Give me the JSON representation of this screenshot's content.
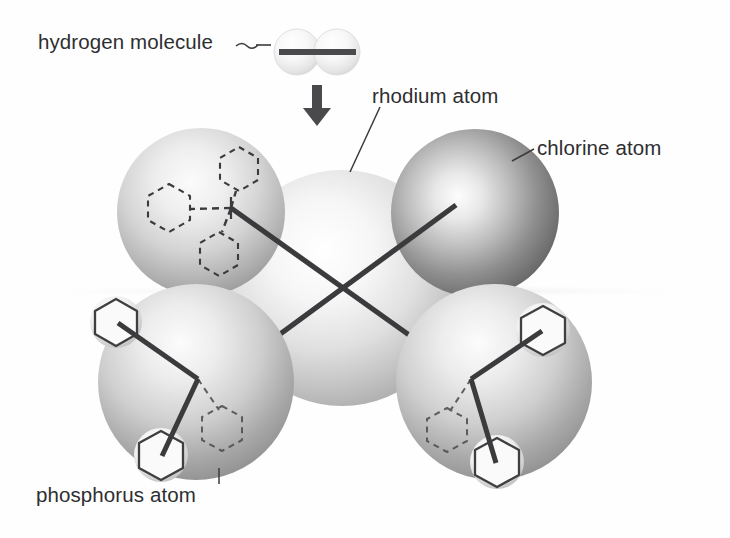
{
  "figure": {
    "kind": "space-filling molecular model",
    "background_color": "#fefefe",
    "label_color": "#2e2e30",
    "bond_color": "#3b3b3d",
    "canvas": {
      "width": 730,
      "height": 538
    }
  },
  "labels": {
    "hydrogen": "hydrogen molecule",
    "rhodium": "rhodium atom",
    "chlorine": "chlorine atom",
    "phosphorus": "phosphorus atom"
  },
  "leaders": {
    "hydrogen": {
      "type": "tilde-dash",
      "x1": 236,
      "y1": 45,
      "x2": 268,
      "y2": 45
    },
    "rhodium": {
      "type": "line",
      "x1": 379,
      "y1": 108,
      "x2": 351,
      "y2": 170
    },
    "chlorine": {
      "type": "line",
      "x1": 534,
      "y1": 150,
      "x2": 513,
      "y2": 160
    },
    "phosphorus": {
      "type": "line",
      "x1": 219,
      "y1": 470,
      "x2": 219,
      "y2": 484
    }
  },
  "arrow": {
    "name": "approach-arrow",
    "direction": "down",
    "x": 317,
    "y_start": 85,
    "y_end": 124,
    "color": "#3b3b3d"
  },
  "hydrogen_molecule": {
    "atoms": [
      {
        "name": "hydrogen-atom-left",
        "cx": 297,
        "cy": 52,
        "r": 23,
        "shade": "very-light"
      },
      {
        "name": "hydrogen-atom-right",
        "cx": 337,
        "cy": 52,
        "r": 23,
        "shade": "very-light"
      }
    ],
    "bond": {
      "x1": 279,
      "y1": 52,
      "x2": 356,
      "y2": 52,
      "width": 6
    }
  },
  "spheres": [
    {
      "name": "rhodium-atom",
      "element": "Rh",
      "cx": 342,
      "cy": 288,
      "r": 118,
      "shade": "lightest",
      "z": 1
    },
    {
      "name": "phosphorus-atom-upper-left",
      "element": "P",
      "cx": 201,
      "cy": 212,
      "r": 84,
      "shade": "light",
      "z": 2
    },
    {
      "name": "chlorine-atom",
      "element": "Cl",
      "cx": 475,
      "cy": 213,
      "r": 84,
      "shade": "dark",
      "z": 2
    },
    {
      "name": "phosphorus-atom-lower-left",
      "element": "P",
      "cx": 196,
      "cy": 382,
      "r": 98,
      "shade": "medium",
      "z": 3
    },
    {
      "name": "phosphorus-atom-lower-right",
      "element": "P",
      "cx": 494,
      "cy": 382,
      "r": 98,
      "shade": "medium",
      "z": 3
    }
  ],
  "bonds": [
    {
      "name": "bond-rhodium-to-upper-left-phosphorus",
      "x1": 231,
      "y1": 208,
      "x2": 459,
      "y2": 370,
      "style": "solid"
    },
    {
      "name": "bond-rhodium-to-chlorine",
      "x1": 228,
      "y1": 372,
      "x2": 455,
      "y2": 206,
      "style": "solid"
    }
  ],
  "phenyl_groups": {
    "upper_left": [
      {
        "name": "phenyl-ring-dashed-top",
        "cx": 239,
        "cy": 169,
        "r": 22,
        "style": "dashed"
      },
      {
        "name": "phenyl-ring-dashed-left",
        "cx": 169,
        "cy": 208,
        "r": 24,
        "style": "dashed"
      },
      {
        "name": "phenyl-ring-dashed-bottom",
        "cx": 219,
        "cy": 254,
        "r": 22,
        "style": "dashed"
      }
    ],
    "lower_left": [
      {
        "name": "phenyl-ring-solid-upper",
        "cx": 116,
        "cy": 322,
        "r": 24,
        "style": "solid"
      },
      {
        "name": "phenyl-ring-solid-lower",
        "cx": 161,
        "cy": 455,
        "r": 25,
        "style": "solid"
      },
      {
        "name": "phenyl-ring-dashed-back",
        "cx": 222,
        "cy": 427,
        "r": 23,
        "style": "dashed"
      }
    ],
    "lower_right": [
      {
        "name": "phenyl-ring-solid-upper",
        "cx": 541,
        "cy": 330,
        "r": 25,
        "style": "solid"
      },
      {
        "name": "phenyl-ring-solid-lower",
        "cx": 496,
        "cy": 462,
        "r": 25,
        "style": "solid"
      },
      {
        "name": "phenyl-ring-dashed-back",
        "cx": 447,
        "cy": 429,
        "r": 23,
        "style": "dashed"
      }
    ]
  },
  "horizon": {
    "name": "ground-shadow-line",
    "y": 290,
    "color": "#e3e3e3"
  }
}
